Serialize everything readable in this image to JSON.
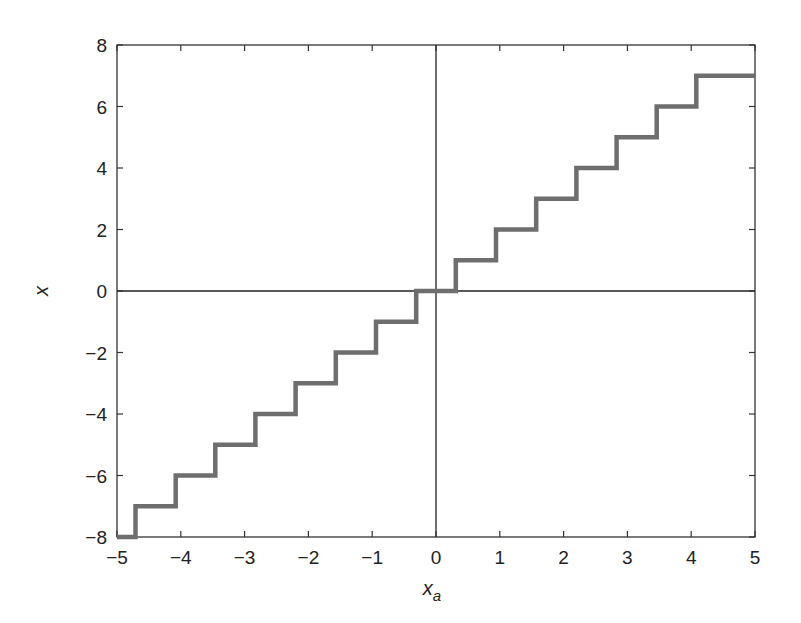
{
  "chart_data": {
    "type": "line",
    "title": "",
    "xlabel": "x_a",
    "ylabel": "x",
    "xlim": [
      -5,
      5
    ],
    "ylim": [
      -8,
      8
    ],
    "xticks": [
      -5,
      -4,
      -3,
      -2,
      -1,
      0,
      1,
      2,
      3,
      4,
      5
    ],
    "yticks": [
      -8,
      -6,
      -4,
      -2,
      0,
      2,
      4,
      6,
      8
    ],
    "grid": false,
    "legend": null,
    "reference_lines": {
      "x": 0,
      "y": 0
    },
    "series": [
      {
        "name": "quantized staircase",
        "style": "step",
        "color": "#6e6e6e",
        "x": [
          -5,
          -4.71,
          -4.71,
          -4.08,
          -4.08,
          -3.46,
          -3.46,
          -2.83,
          -2.83,
          -2.2,
          -2.2,
          -1.57,
          -1.57,
          -0.94,
          -0.94,
          -0.31,
          -0.31,
          0.31,
          0.31,
          0.94,
          0.94,
          1.57,
          1.57,
          2.2,
          2.2,
          2.83,
          2.83,
          3.46,
          3.46,
          4.08,
          4.08,
          5
        ],
        "y": [
          -8,
          -8,
          -7,
          -7,
          -6,
          -6,
          -5,
          -5,
          -4,
          -4,
          -3,
          -3,
          -2,
          -2,
          -1,
          -1,
          0,
          0,
          1,
          1,
          2,
          2,
          3,
          3,
          4,
          4,
          5,
          5,
          6,
          6,
          7,
          7
        ]
      }
    ]
  }
}
